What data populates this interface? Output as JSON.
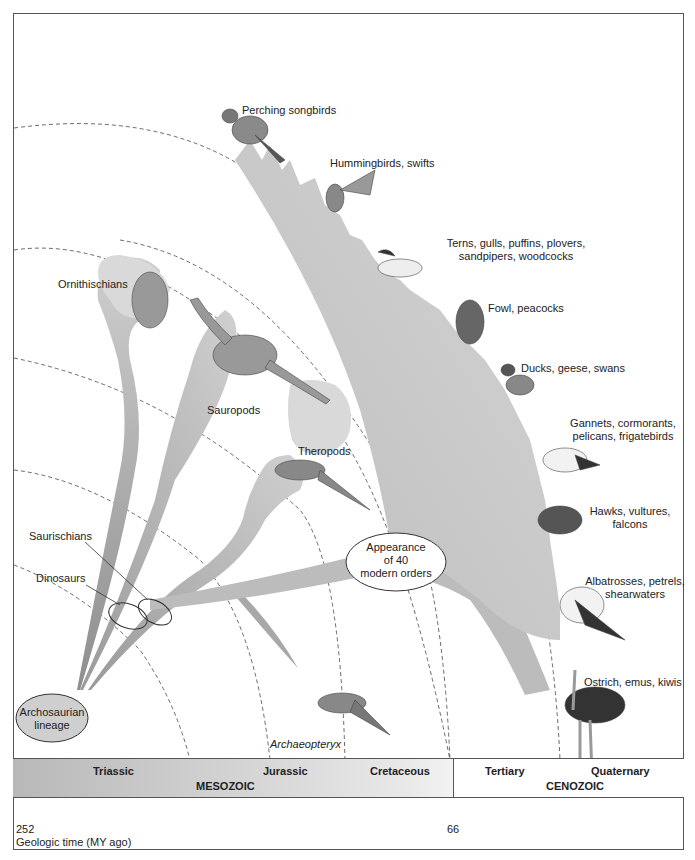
{
  "diagram": {
    "title": "",
    "nodes": {
      "root": "Archosaurian\nlineage",
      "root_line1": "Archosaurian",
      "root_line2": "lineage",
      "dinosaurs": "Dinosaurs",
      "saurischians": "Saurischians",
      "ornithischians": "Ornithischians",
      "sauropods": "Sauropods",
      "theropods": "Theropods",
      "archaeopteryx": "Archaeopteryx",
      "modern_orders": {
        "line1": "Appearance",
        "line2": "of 40",
        "line3": "modern orders"
      }
    },
    "bird_groups": [
      {
        "line1": "Perching songbirds",
        "line2": ""
      },
      {
        "line1": "Hummingbirds, swifts",
        "line2": ""
      },
      {
        "line1": "Terns, gulls, puffins, plovers,",
        "line2": "sandpipers, woodcocks"
      },
      {
        "line1": "Fowl, peacocks",
        "line2": ""
      },
      {
        "line1": "Ducks, geese, swans",
        "line2": ""
      },
      {
        "line1": "Gannets, cormorants,",
        "line2": "pelicans, frigatebirds"
      },
      {
        "line1": "Hawks, vultures,",
        "line2": "falcons"
      },
      {
        "line1": "Albatrosses, petrels,",
        "line2": "shearwaters"
      },
      {
        "line1": "Ostrich, emus, kiwis",
        "line2": ""
      }
    ],
    "colors": {
      "branch_fill": "#c8c8c8",
      "branch_dark": "#9a9a9a",
      "node_fill": "#d6d6d6",
      "outline": "#333333",
      "border": "#555555"
    }
  },
  "timeline": {
    "eras": [
      {
        "name": "MESOZOIC",
        "periods": [
          "Triassic",
          "Jurassic",
          "Cretaceous"
        ]
      },
      {
        "name": "CENOZOIC",
        "periods": [
          "Tertiary",
          "Quaternary"
        ]
      }
    ],
    "ticks": [
      "252",
      "66"
    ],
    "axis_label": "Geologic time (MY ago)"
  }
}
